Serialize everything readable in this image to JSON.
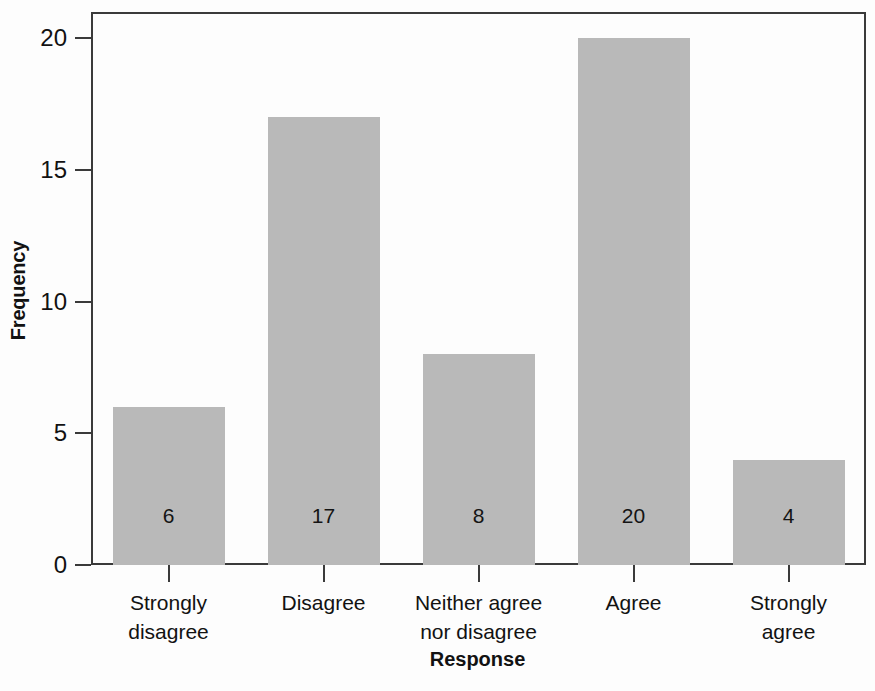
{
  "chart_data": {
    "type": "bar",
    "title": "",
    "xlabel": "Response",
    "ylabel": "Frequency",
    "categories": [
      "Strongly disagree",
      "Disagree",
      "Neither agree nor disagree",
      "Agree",
      "Strongly agree"
    ],
    "category_lines": [
      [
        "Strongly",
        "disagree"
      ],
      [
        "Disagree",
        ""
      ],
      [
        "Neither agree",
        "nor disagree"
      ],
      [
        "Agree",
        ""
      ],
      [
        "Strongly",
        "agree"
      ]
    ],
    "values": [
      6,
      17,
      8,
      20,
      4
    ],
    "value_labels": [
      "6",
      "17",
      "8",
      "20",
      "4"
    ],
    "ylim": [
      0,
      21
    ],
    "yticks": [
      0,
      5,
      10,
      15,
      20
    ],
    "ytick_labels": [
      "0",
      "5",
      "10",
      "15",
      "20"
    ],
    "grid": false,
    "legend": "none",
    "bar_color": "#b9b9b9",
    "axis_color": "#3a3a3a",
    "text_color": "#121212",
    "background": "#fdfdfd"
  }
}
